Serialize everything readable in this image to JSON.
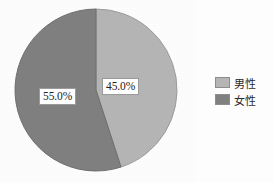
{
  "chart_data": {
    "type": "pie",
    "title": "",
    "categories": [
      "男性",
      "女性"
    ],
    "values": [
      45.0,
      55.0
    ],
    "value_labels": [
      "45.0%",
      "55.0%"
    ],
    "colors": [
      "#b5b5b5",
      "#808080"
    ],
    "legend": {
      "position": "right",
      "entries": [
        {
          "label": "男性",
          "color": "#b5b5b5",
          "value": 45.0,
          "value_label": "45.0%"
        },
        {
          "label": "女性",
          "color": "#808080",
          "value": 55.0,
          "value_label": "55.0%"
        }
      ]
    },
    "start_angle_deg": 0,
    "direction": "clockwise",
    "grid": false,
    "xlabel": "",
    "ylabel": ""
  },
  "pie": {
    "slices": [
      {
        "name": "male-slice",
        "label": "45.0%",
        "color": "#b5b5b5",
        "edge": "#9c9c9c"
      },
      {
        "name": "female-slice",
        "label": "55.0%",
        "color": "#808080",
        "edge": "#6e6e6e"
      }
    ]
  },
  "colors": {
    "background": "#fdfdfd",
    "male": "#b5b5b5",
    "female": "#808080",
    "label_box_background": "#ffffff",
    "label_box_border": "#9a9a9a",
    "text": "#232323"
  }
}
